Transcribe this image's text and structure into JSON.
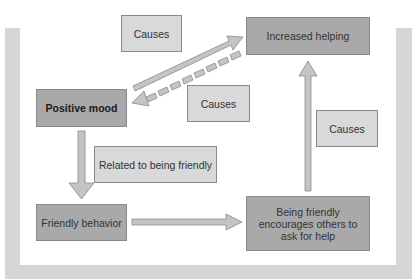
{
  "diagram": {
    "nodes": {
      "positive_mood": "Positive mood",
      "increased_helping": "Increased helping",
      "friendly_behavior": "Friendly behavior",
      "being_friendly": "Being friendly encourages others to ask for help"
    },
    "labels": {
      "causes_top": "Causes",
      "causes_middle": "Causes",
      "causes_right": "Causes",
      "related": "Related to being friendly"
    },
    "edges": [
      {
        "from": "Positive mood",
        "to": "Increased helping",
        "style": "solid",
        "label": "Causes"
      },
      {
        "from": "Increased helping",
        "to": "Positive mood",
        "style": "dashed",
        "label": "Causes"
      },
      {
        "from": "Positive mood",
        "to": "Friendly behavior",
        "style": "solid",
        "label": "Related to being friendly"
      },
      {
        "from": "Friendly behavior",
        "to": "Being friendly encourages others to ask for help",
        "style": "solid",
        "label": ""
      },
      {
        "from": "Being friendly encourages others to ask for help",
        "to": "Increased helping",
        "style": "solid",
        "label": "Causes"
      }
    ],
    "colors": {
      "node_fill": "#a9a9a9",
      "label_fill": "#d9d9d9",
      "arrow_fill": "#c4c4c4",
      "frame": "#d6d6d6"
    }
  }
}
